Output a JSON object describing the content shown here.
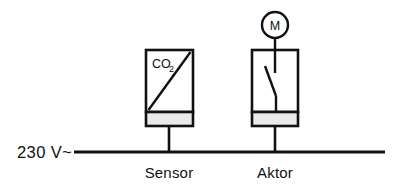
{
  "diagram": {
    "supply": {
      "label": "230 V~",
      "line_color": "#111111"
    },
    "components": [
      {
        "id": "sensor",
        "caption": "Sensor",
        "box_label": "CO",
        "box_label_subscript": "2",
        "symbol": "diagonal-ramp",
        "bar_color": "#e9e9e9"
      },
      {
        "id": "aktor",
        "caption": "Aktor",
        "symbol": "switch-contact",
        "bar_color": "#e9e9e9",
        "load": {
          "label": "M",
          "name": "motor-symbol"
        }
      }
    ],
    "colors": {
      "stroke": "#111111",
      "fill": "#ffffff",
      "bar": "#e9e9e9"
    }
  }
}
